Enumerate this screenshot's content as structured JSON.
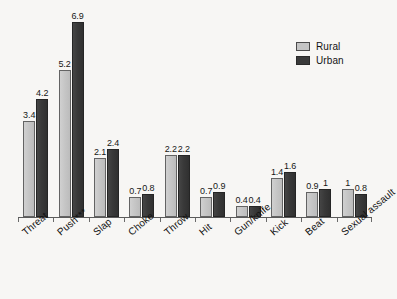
{
  "chart_data": {
    "type": "bar",
    "title": "",
    "subtitle": "",
    "xlabel": "",
    "ylabel": "",
    "ylim": [
      0,
      7.2
    ],
    "grid": false,
    "legend_position": "top-right",
    "orientation": "vertical",
    "grouping": "grouped",
    "categories": [
      "Threat",
      "Push***",
      "Slap",
      "Choke",
      "Throw",
      "Hit",
      "Gun/knife",
      "Kick",
      "Beat",
      "Sexual assault"
    ],
    "series": [
      {
        "name": "Rural",
        "color": "#c4c4c4",
        "values": [
          3.4,
          5.2,
          2.1,
          0.7,
          2.2,
          0.7,
          0.4,
          1.4,
          0.9,
          1
        ],
        "labels": [
          "3.4",
          "5.2",
          "2.1",
          "0.7",
          "2.2",
          "0.7",
          "0.4",
          "1.4",
          "0.9",
          "1"
        ]
      },
      {
        "name": "Urban",
        "color": "#3a3a3a",
        "values": [
          4.2,
          6.9,
          2.4,
          0.8,
          2.2,
          0.9,
          0.4,
          1.6,
          1,
          0.8
        ],
        "labels": [
          "4.2",
          "6.9",
          "2.4",
          "0.8",
          "2.2",
          "0.9",
          "0.4",
          "1.6",
          "1",
          "0.8"
        ]
      }
    ],
    "annotations": [
      "*** denotes statistical significance for Push"
    ]
  },
  "legend": {
    "items": [
      {
        "label": "Rural",
        "color": "#c4c4c4"
      },
      {
        "label": "Urban",
        "color": "#3a3a3a"
      }
    ]
  }
}
